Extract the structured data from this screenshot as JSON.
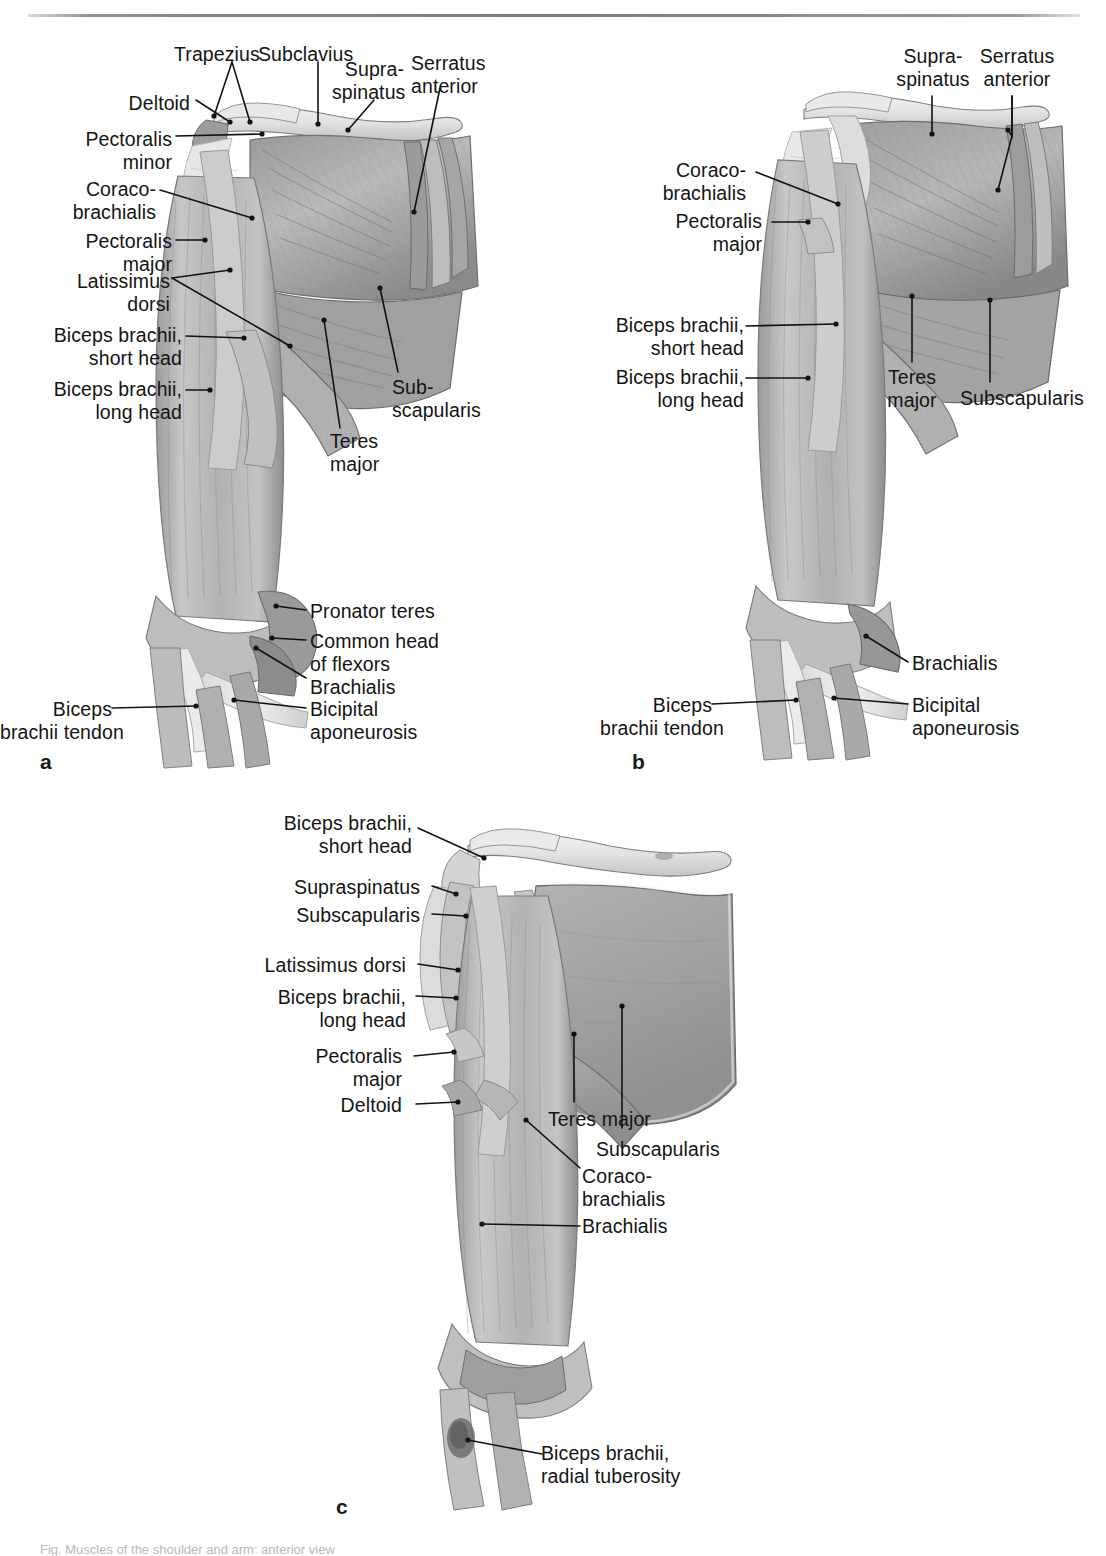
{
  "page": {
    "background": "#ffffff",
    "rule_color": "#7c7c7c",
    "ink_color": "#141414",
    "width": 1106,
    "height": 1555,
    "truncated_caption": "Fig.  Muscles of the shoulder and arm: anterior view"
  },
  "figure": {
    "type": "anatomical-illustration",
    "panel_count": 3,
    "palette": {
      "muscle_light": "#cfcfcf",
      "muscle_mid": "#a8a8a8",
      "muscle_dark": "#7d7d7d",
      "muscle_shadow": "#5e5e5e",
      "bone_light": "#efefef",
      "bone_mid": "#d4d4d4",
      "tendon": "#e4e4e4",
      "outline": "#4a4a4a"
    }
  },
  "panels": [
    {
      "letter": "a",
      "letter_x": 40,
      "letter_y": 752,
      "view": "superficial anterior view",
      "labels": [
        {
          "text": "Trapezius",
          "x": 174,
          "y": 43,
          "align": "left",
          "leader": "diagonal-down-right"
        },
        {
          "text": "Subclavius",
          "x": 258,
          "y": 43,
          "align": "left",
          "leader": "diagonal-down-right"
        },
        {
          "text": "Supra-\nspinatus",
          "x": 350,
          "y": 58,
          "align": "left",
          "leader": "diagonal-down-left"
        },
        {
          "text": "Serratus\nanterior",
          "x": 413,
          "y": 52,
          "align": "left",
          "leader": "diagonal-down-left"
        },
        {
          "text": "Deltoid",
          "x": 130,
          "y": 92,
          "align": "left",
          "leader": "horizontal-right"
        },
        {
          "text": "Pectoralis\nminor",
          "x": 82,
          "y": 130,
          "align": "left",
          "leader": "horizontal-right"
        },
        {
          "text": "Coraco-\nbrachialis",
          "x": 93,
          "y": 180,
          "align": "left",
          "leader": "diagonal-down-right"
        },
        {
          "text": "Pectoralis\nmajor",
          "x": 96,
          "y": 232,
          "align": "left",
          "leader": "horizontal-right"
        },
        {
          "text": "Latissimus\ndorsi",
          "x": 78,
          "y": 272,
          "align": "left",
          "leader": "fork-right"
        },
        {
          "text": "Biceps brachii,\nshort head",
          "x": 57,
          "y": 325,
          "align": "left",
          "leader": "horizontal-right"
        },
        {
          "text": "Biceps brachii,\nlong head",
          "x": 57,
          "y": 378,
          "align": "left",
          "leader": "horizontal-right"
        },
        {
          "text": "Sub-\nscapularis",
          "x": 392,
          "y": 378,
          "align": "left",
          "leader": "diagonal-up-left"
        },
        {
          "text": "Teres\nmajor",
          "x": 330,
          "y": 432,
          "align": "left",
          "leader": "diagonal-up-right"
        },
        {
          "text": "Pronator teres",
          "x": 310,
          "y": 602,
          "align": "left",
          "leader": "horizontal-left"
        },
        {
          "text": "Common head\nof flexors",
          "x": 310,
          "y": 633,
          "align": "left",
          "leader": "horizontal-left"
        },
        {
          "text": "Brachialis",
          "x": 310,
          "y": 678,
          "align": "left",
          "leader": "diagonal-up-left"
        },
        {
          "text": "Bicipital\naponeurosis",
          "x": 310,
          "y": 700,
          "align": "left",
          "leader": "horizontal-left"
        },
        {
          "text": "Biceps\nbrachii tendon",
          "x": 20,
          "y": 700,
          "align": "left",
          "leader": "horizontal-right"
        }
      ]
    },
    {
      "letter": "b",
      "letter_x": 632,
      "letter_y": 752,
      "view": "pectoralis major and deltoid removed",
      "labels": [
        {
          "text": "Supra-\nspinatus",
          "x": 905,
          "y": 45,
          "align": "left",
          "leader": "vertical-down"
        },
        {
          "text": "Serratus\nanterior",
          "x": 993,
          "y": 45,
          "align": "left",
          "leader": "vertical-down"
        },
        {
          "text": "Coraco-\nbrachialis",
          "x": 692,
          "y": 161,
          "align": "left",
          "leader": "diagonal-down-right"
        },
        {
          "text": "Pectoralis\nmajor",
          "x": 706,
          "y": 212,
          "align": "left",
          "leader": "horizontal-right"
        },
        {
          "text": "Biceps brachii,\nshort head",
          "x": 649,
          "y": 314,
          "align": "left",
          "leader": "horizontal-right"
        },
        {
          "text": "Biceps brachii,\nlong head",
          "x": 649,
          "y": 366,
          "align": "left",
          "leader": "horizontal-right"
        },
        {
          "text": "Teres\nmajor",
          "x": 903,
          "y": 366,
          "align": "left",
          "leader": "vertical-up"
        },
        {
          "text": "Subscapularis",
          "x": 960,
          "y": 387,
          "align": "left",
          "leader": "vertical-up"
        },
        {
          "text": "Brachialis",
          "x": 912,
          "y": 652,
          "align": "left",
          "leader": "diagonal-up-left"
        },
        {
          "text": "Bicipital\naponeurosis",
          "x": 912,
          "y": 695,
          "align": "left",
          "leader": "horizontal-left"
        },
        {
          "text": "Biceps\nbrachii tendon",
          "x": 646,
          "y": 695,
          "align": "left",
          "leader": "horizontal-right"
        }
      ]
    },
    {
      "letter": "c",
      "letter_x": 336,
      "letter_y": 1505,
      "view": "deep layer, biceps and coracobrachialis divided",
      "labels": [
        {
          "text": "Biceps brachii,\nshort head",
          "x": 318,
          "y": 815,
          "align": "left",
          "leader": "diagonal-down-right"
        },
        {
          "text": "Supraspinatus",
          "x": 308,
          "y": 880,
          "align": "left",
          "leader": "diagonal-down-right"
        },
        {
          "text": "Subscapularis",
          "x": 308,
          "y": 908,
          "align": "left",
          "leader": "horizontal-right"
        },
        {
          "text": "Latissimus dorsi",
          "x": 288,
          "y": 957,
          "align": "left",
          "leader": "diagonal-down-right"
        },
        {
          "text": "Biceps brachii,\nlong head",
          "x": 290,
          "y": 988,
          "align": "left",
          "leader": "horizontal-right"
        },
        {
          "text": "Pectoralis\nmajor",
          "x": 345,
          "y": 1048,
          "align": "left",
          "leader": "horizontal-right"
        },
        {
          "text": "Deltoid",
          "x": 382,
          "y": 1097,
          "align": "left",
          "leader": "horizontal-right"
        },
        {
          "text": "Teres major",
          "x": 548,
          "y": 1110,
          "align": "left",
          "leader": "vertical-up"
        },
        {
          "text": "Subscapularis",
          "x": 596,
          "y": 1140,
          "align": "left",
          "leader": "vertical-up"
        },
        {
          "text": "Coraco-\nbrachialis",
          "x": 578,
          "y": 1167,
          "align": "left",
          "leader": "diagonal-up-left"
        },
        {
          "text": "Brachialis",
          "x": 578,
          "y": 1225,
          "align": "left",
          "leader": "horizontal-left"
        },
        {
          "text": "Biceps brachii,\nradial tuberosity",
          "x": 537,
          "y": 1452,
          "align": "left",
          "leader": "horizontal-left"
        }
      ]
    }
  ]
}
